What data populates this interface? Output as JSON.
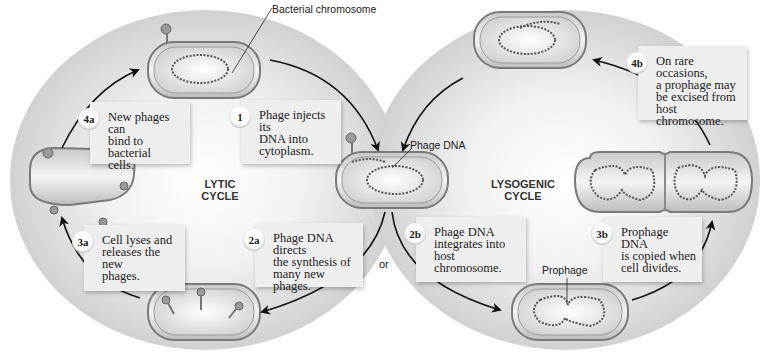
{
  "diagram": {
    "cycles": {
      "lytic": "LYTIC\nCYCLE",
      "lysogenic": "LYSOGENIC\nCYCLE"
    },
    "callouts": {
      "bacterial_chromosome": "Bacterial chromosome",
      "phage_dna": "Phage DNA",
      "prophage": "Prophage",
      "or": "or"
    },
    "steps": [
      {
        "id": "1",
        "number": "1",
        "text": "Phage injects its\nDNA into\ncytoplasm."
      },
      {
        "id": "2a",
        "number": "2a",
        "text": "Phage DNA directs\nthe synthesis of\nmany new phages."
      },
      {
        "id": "3a",
        "number": "3a",
        "text": "Cell lyses and\nreleases the new\nphages."
      },
      {
        "id": "4a",
        "number": "4a",
        "text": "New phages can\nbind to bacterial\ncells."
      },
      {
        "id": "2b",
        "number": "2b",
        "text": "Phage DNA\nintegrates into\nhost chromosome."
      },
      {
        "id": "3b",
        "number": "3b",
        "text": "Prophage DNA\nis copied when\ncell divides."
      },
      {
        "id": "4b",
        "number": "4b",
        "text": "On rare occasions,\na prophage may\nbe excised from\nhost chromosome."
      }
    ],
    "colors": {
      "background": "#ffffff",
      "cell_fill": "#d9d9d9",
      "cell_wall": "#8a8a8a",
      "box_fill": "#eeeeee",
      "arrow": "#111111",
      "dna": "#555555"
    }
  }
}
